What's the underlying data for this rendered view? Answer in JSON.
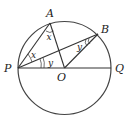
{
  "diagram": {
    "type": "circle-geometry",
    "points": {
      "P": "P",
      "Q": "Q",
      "O": "O",
      "A": "A",
      "B": "B"
    },
    "angle_labels": {
      "x_at_A": "x",
      "x_at_P": "x",
      "y_at_P": "y",
      "y_at_B": "y"
    },
    "segments": [
      "PQ",
      "PA",
      "AO",
      "PB",
      "OB"
    ]
  },
  "colors": {
    "stroke": "#333333",
    "background": "#ffffff"
  }
}
